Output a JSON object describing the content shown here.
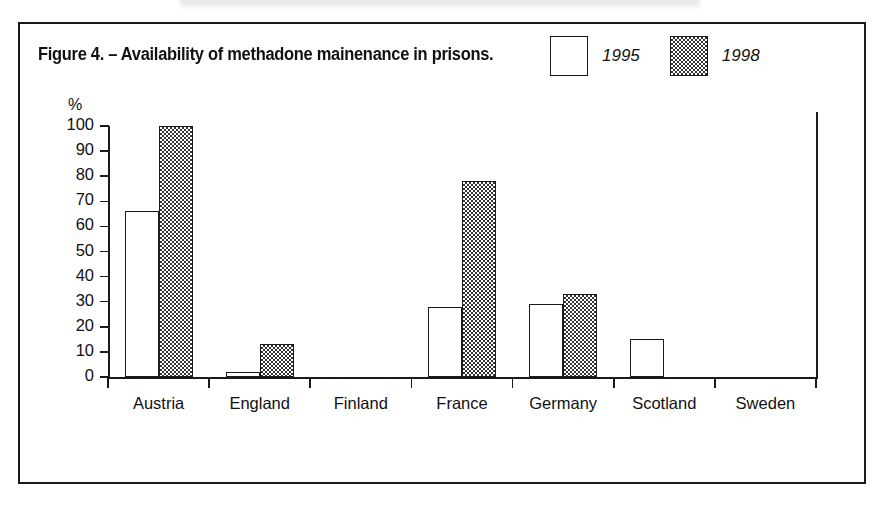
{
  "figure": {
    "title": "Figure 4. – Availability of methadone mainenance in prisons.",
    "frame_border_color": "#1a1a1a"
  },
  "legend": {
    "position": "top-right",
    "entries": [
      {
        "label": "1995",
        "swatch": "empty-box",
        "fill": "#ffffff"
      },
      {
        "label": "1998",
        "swatch": "checkered-box",
        "fill": "#333333"
      }
    ]
  },
  "axis": {
    "y_unit_label": "%",
    "y_ticks": [
      "100",
      "90",
      "80",
      "70",
      "60",
      "50",
      "40",
      "30",
      "20",
      "10",
      "0"
    ]
  },
  "chart_data": {
    "type": "bar",
    "title": "Figure 4. – Availability of methadone mainenance in prisons.",
    "xlabel": "",
    "ylabel": "%",
    "ylim": [
      0,
      100
    ],
    "ytick_step": 10,
    "grid": false,
    "legend_position": "top-right",
    "categories": [
      "Austria",
      "England",
      "Finland",
      "France",
      "Germany",
      "Scotland",
      "Sweden"
    ],
    "series": [
      {
        "name": "1995",
        "values": [
          66,
          2,
          0,
          28,
          29,
          15,
          0
        ]
      },
      {
        "name": "1998",
        "values": [
          100,
          13,
          0,
          78,
          33,
          0,
          0
        ]
      }
    ],
    "annotations": []
  }
}
